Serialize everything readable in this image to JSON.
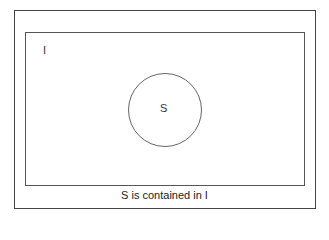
{
  "diagram": {
    "type": "venn",
    "universe_label": "I",
    "subset_label": "S",
    "caption": "S is contained in I",
    "colors": {
      "frame": "#444444",
      "universe": "#555555",
      "circle": "#666666",
      "text": "#333333"
    }
  }
}
